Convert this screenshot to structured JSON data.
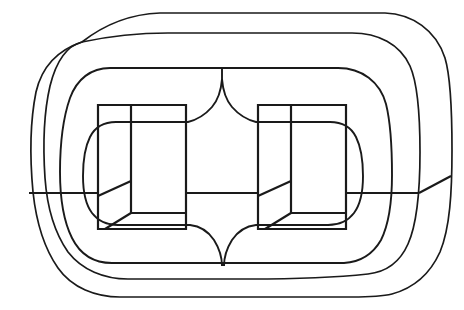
{
  "figure": {
    "title": "Nested rounded-rectangle loop diagram with two open box forms",
    "type": "line-drawing",
    "background_color": "#ffffff",
    "stroke_color": "#1a1a1a",
    "canvas": {
      "width": 464,
      "height": 310
    },
    "elements": [
      {
        "name": "outer-loop",
        "label": "Outer loop band",
        "stroke_width": 1.7,
        "bounds": {
          "x": 28,
          "y": 13,
          "width": 424,
          "height": 284
        }
      },
      {
        "name": "middle-loop",
        "label": "Middle loop band",
        "stroke_width": 1.7,
        "bounds": {
          "x": 28,
          "y": 32,
          "width": 392,
          "height": 247
        }
      },
      {
        "name": "inner-loop",
        "label": "Inner loop band",
        "stroke_width": 1.9,
        "bounds": {
          "x": 57,
          "y": 67,
          "width": 335,
          "height": 197
        }
      },
      {
        "name": "inner-lobe-left",
        "label": "Left inner lobe",
        "stroke_width": 1.9
      },
      {
        "name": "inner-lobe-right",
        "label": "Right inner lobe",
        "stroke_width": 1.9
      },
      {
        "name": "box-left",
        "label": "Left open box (oblique projection)",
        "stroke_width": 2.2,
        "bounds": {
          "x": 98,
          "y": 105,
          "width": 88,
          "height": 124
        }
      },
      {
        "name": "box-right",
        "label": "Right open box (oblique projection)",
        "stroke_width": 2.2,
        "bounds": {
          "x": 258,
          "y": 105,
          "width": 88,
          "height": 124
        }
      },
      {
        "name": "horizontal-bar",
        "label": "Horizontal mid-height bar",
        "stroke_width": 2.2,
        "y": 193,
        "x_start": 29,
        "x_end": 450
      }
    ],
    "crossings": [
      {
        "name": "crossing-upper-left",
        "x": 82,
        "y": 42
      },
      {
        "name": "crossing-lower-right",
        "x": 400,
        "y": 272
      }
    ]
  }
}
